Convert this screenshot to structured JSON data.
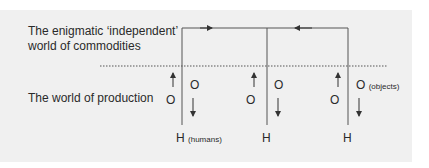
{
  "diagram": {
    "upper_label_line1": "The enigmatic ‘independent’",
    "upper_label_line2": "world of commodities",
    "lower_label": "The world of production",
    "columns": [
      {
        "o_left": "O",
        "o_right": "O",
        "o_right_note": "",
        "h": "H",
        "h_note": "(humans)"
      },
      {
        "o_left": "O",
        "o_right": "O",
        "o_right_note": "",
        "h": "H",
        "h_note": ""
      },
      {
        "o_left": "O",
        "o_right": "O",
        "o_right_note": "(objects)",
        "h": "H",
        "h_note": ""
      }
    ],
    "colors": {
      "panel": "#f0f0f0",
      "lines": "#555555",
      "text": "#2a2a2a"
    }
  }
}
